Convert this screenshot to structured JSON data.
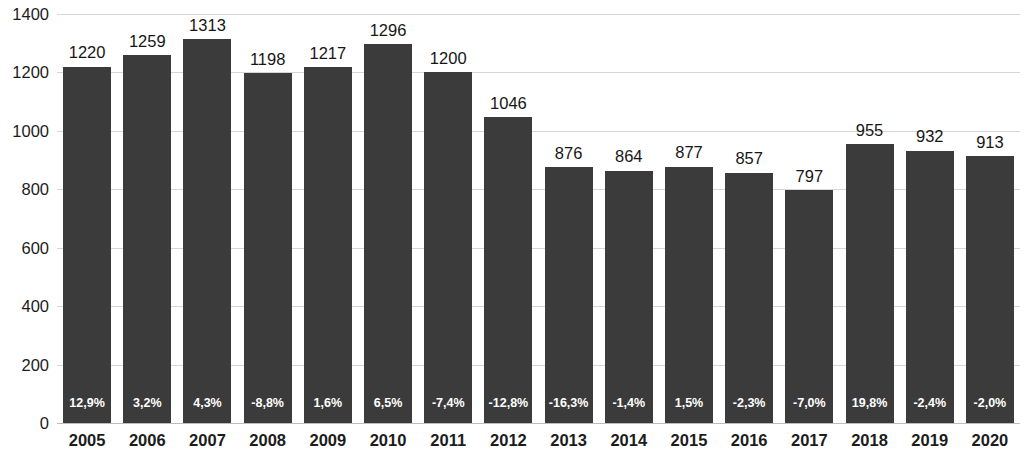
{
  "chart_data": {
    "type": "bar",
    "title": "",
    "subtitle": "",
    "xlabel": "",
    "ylabel": "",
    "ylim": [
      0,
      1400
    ],
    "ytick_step": 200,
    "yticks": [
      "0",
      "200",
      "400",
      "600",
      "800",
      "1000",
      "1200",
      "1400"
    ],
    "grid": true,
    "legend": "none",
    "bar_color": "#3b3b3b",
    "gridline_color": "#d6d6d6",
    "axis_color": "#bdbdbd",
    "value_label_color": "#161616",
    "pct_label_color": "#ffffff",
    "categories": [
      "2005",
      "2006",
      "2007",
      "2008",
      "2009",
      "2010",
      "2011",
      "2012",
      "2013",
      "2014",
      "2015",
      "2016",
      "2017",
      "2018",
      "2019",
      "2020"
    ],
    "values": [
      1220,
      1259,
      1313,
      1198,
      1217,
      1296,
      1200,
      1046,
      876,
      864,
      877,
      857,
      797,
      955,
      932,
      913
    ],
    "value_labels": [
      "1220",
      "1259",
      "1313",
      "1198",
      "1217",
      "1296",
      "1200",
      "1046",
      "876",
      "864",
      "877",
      "857",
      "797",
      "955",
      "932",
      "913"
    ],
    "pct_labels": [
      "12,9%",
      "3,2%",
      "4,3%",
      "-8,8%",
      "1,6%",
      "6,5%",
      "-7,4%",
      "-12,8%",
      "-16,3%",
      "-1,4%",
      "1,5%",
      "-2,3%",
      "-7,0%",
      "19,8%",
      "-2,4%",
      "-2,0%"
    ],
    "series": [
      {
        "name": "value",
        "values": [
          1220,
          1259,
          1313,
          1198,
          1217,
          1296,
          1200,
          1046,
          876,
          864,
          877,
          857,
          797,
          955,
          932,
          913
        ]
      },
      {
        "name": "change_percent",
        "values": [
          12.9,
          3.2,
          4.3,
          -8.8,
          1.6,
          6.5,
          -7.4,
          -12.8,
          -16.3,
          -1.4,
          1.5,
          -2.3,
          -7.0,
          19.8,
          -2.4,
          -2.0
        ]
      }
    ]
  }
}
